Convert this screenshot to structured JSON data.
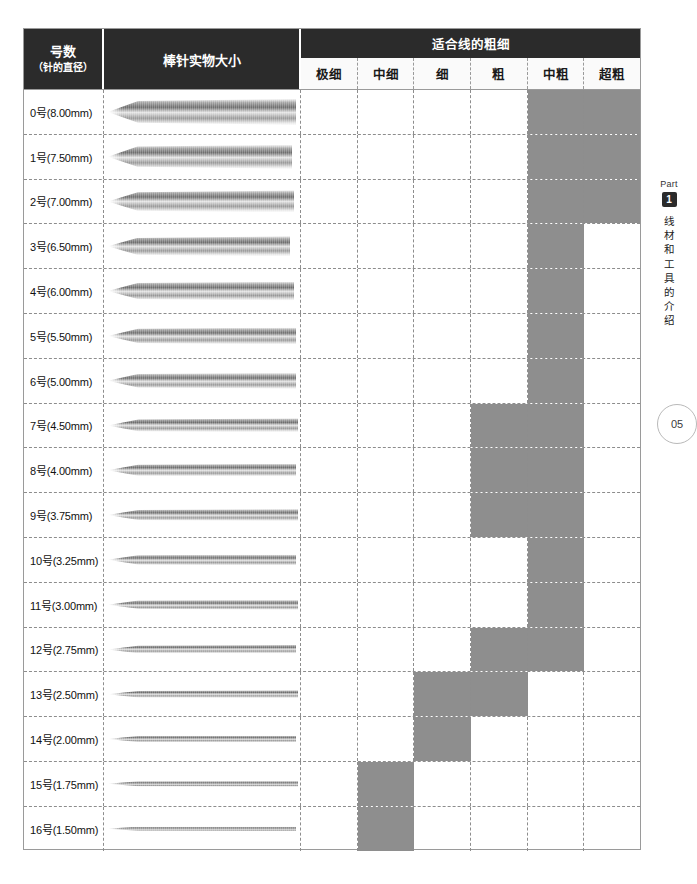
{
  "header": {
    "col_number": {
      "line1": "号数",
      "line2": "（针的直径）"
    },
    "col_picture": "棒针实物大小",
    "group_title": "适合线的粗细",
    "thickness_columns": [
      "极细",
      "中细",
      "细",
      "粗",
      "中粗",
      "超粗"
    ]
  },
  "side_panel": {
    "part_label": "Part",
    "part_number": "1",
    "vertical_text": [
      "线",
      "材",
      "和",
      "工",
      "具",
      "的",
      "介",
      "绍"
    ]
  },
  "page_number": "05",
  "colors": {
    "header_bg": "#2b2b2b",
    "cell_fill": "#8e8e8e",
    "grid_line": "#8d8d8d",
    "border": "#9a9a9a",
    "page_bg": "#ffffff"
  },
  "chart_data": {
    "type": "table",
    "columns": [
      "号数（针的直径）",
      "棒针实物大小",
      "极细",
      "中细",
      "细",
      "粗",
      "中粗",
      "超粗"
    ],
    "categories": [
      "极细",
      "中细",
      "细",
      "粗",
      "中粗",
      "超粗"
    ],
    "rows": [
      {
        "label": "0号(8.00mm)",
        "diameter_mm": 8.0,
        "needle_width_pct": 96,
        "needle_height_px": 26,
        "marks": [
          false,
          false,
          false,
          false,
          true,
          true
        ]
      },
      {
        "label": "1号(7.50mm)",
        "diameter_mm": 7.5,
        "needle_width_pct": 94,
        "needle_height_px": 24,
        "marks": [
          false,
          false,
          false,
          false,
          true,
          true
        ]
      },
      {
        "label": "2号(7.00mm)",
        "diameter_mm": 7.0,
        "needle_width_pct": 95,
        "needle_height_px": 22,
        "marks": [
          false,
          false,
          false,
          false,
          true,
          true
        ]
      },
      {
        "label": "3号(6.50mm)",
        "diameter_mm": 6.5,
        "needle_width_pct": 93,
        "needle_height_px": 20,
        "marks": [
          false,
          false,
          false,
          false,
          true,
          false
        ]
      },
      {
        "label": "4号(6.00mm)",
        "diameter_mm": 6.0,
        "needle_width_pct": 95,
        "needle_height_px": 19,
        "marks": [
          false,
          false,
          false,
          false,
          true,
          false
        ]
      },
      {
        "label": "5号(5.50mm)",
        "diameter_mm": 5.5,
        "needle_width_pct": 96,
        "needle_height_px": 17,
        "marks": [
          false,
          false,
          false,
          false,
          true,
          false
        ]
      },
      {
        "label": "6号(5.00mm)",
        "diameter_mm": 5.0,
        "needle_width_pct": 96,
        "needle_height_px": 16,
        "marks": [
          false,
          false,
          false,
          false,
          true,
          false
        ]
      },
      {
        "label": "7号(4.50mm)",
        "diameter_mm": 4.5,
        "needle_width_pct": 97,
        "needle_height_px": 14,
        "marks": [
          false,
          false,
          false,
          true,
          true,
          false
        ]
      },
      {
        "label": "8号(4.00mm)",
        "diameter_mm": 4.0,
        "needle_width_pct": 96,
        "needle_height_px": 13,
        "marks": [
          false,
          false,
          false,
          true,
          true,
          false
        ]
      },
      {
        "label": "9号(3.75mm)",
        "diameter_mm": 3.75,
        "needle_width_pct": 97,
        "needle_height_px": 12,
        "marks": [
          false,
          false,
          false,
          true,
          true,
          false
        ]
      },
      {
        "label": "10号(3.25mm)",
        "diameter_mm": 3.25,
        "needle_width_pct": 96,
        "needle_height_px": 11,
        "marks": [
          false,
          false,
          false,
          false,
          true,
          false
        ]
      },
      {
        "label": "11号(3.00mm)",
        "diameter_mm": 3.0,
        "needle_width_pct": 97,
        "needle_height_px": 10,
        "marks": [
          false,
          false,
          false,
          false,
          true,
          false
        ]
      },
      {
        "label": "12号(2.75mm)",
        "diameter_mm": 2.75,
        "needle_width_pct": 96,
        "needle_height_px": 9,
        "marks": [
          false,
          false,
          false,
          true,
          true,
          false
        ]
      },
      {
        "label": "13号(2.50mm)",
        "diameter_mm": 2.5,
        "needle_width_pct": 97,
        "needle_height_px": 8,
        "marks": [
          false,
          false,
          true,
          true,
          false,
          false
        ]
      },
      {
        "label": "14号(2.00mm)",
        "diameter_mm": 2.0,
        "needle_width_pct": 96,
        "needle_height_px": 7,
        "marks": [
          false,
          false,
          true,
          false,
          false,
          false
        ]
      },
      {
        "label": "15号(1.75mm)",
        "diameter_mm": 1.75,
        "needle_width_pct": 97,
        "needle_height_px": 6,
        "marks": [
          false,
          true,
          false,
          false,
          false,
          false
        ]
      },
      {
        "label": "16号(1.50mm)",
        "diameter_mm": 1.5,
        "needle_width_pct": 96,
        "needle_height_px": 5,
        "marks": [
          false,
          true,
          false,
          false,
          false,
          false
        ]
      }
    ]
  }
}
